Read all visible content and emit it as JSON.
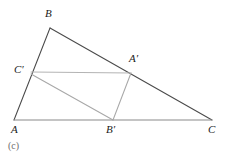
{
  "figure": {
    "caption": "(c)",
    "background_color": "#ffffff",
    "width": 226,
    "height": 161
  },
  "colors": {
    "outer_triangle_stroke": "#4a4a4a",
    "base_line_stroke": "#8a8a8a",
    "inner_horizontal_stroke": "#b4b4b4",
    "inner_diagonal_stroke": "#a8a8a8",
    "inner_vertical_stroke": "#a8a8a8",
    "label_color": "#1a1a1a",
    "caption_color": "#6e6e6e"
  },
  "points": {
    "A": {
      "label": "A",
      "x": 14,
      "y": 120,
      "label_x": 11,
      "label_y": 124
    },
    "B": {
      "label": "B",
      "x": 50,
      "y": 28,
      "label_x": 45,
      "label_y": 8
    },
    "C": {
      "label": "C",
      "x": 212,
      "y": 120,
      "label_x": 208,
      "label_y": 124
    },
    "Aprime": {
      "label": "A′",
      "x": 131,
      "y": 73,
      "label_x": 129,
      "label_y": 53
    },
    "Bprime": {
      "label": "B′",
      "x": 113,
      "y": 120,
      "label_x": 106,
      "label_y": 124
    },
    "Cprime": {
      "label": "C′",
      "x": 31,
      "y": 72,
      "label_x": 14,
      "label_y": 64
    }
  },
  "segments": [
    {
      "name": "side-AB",
      "from": "A",
      "to": "B",
      "style": "outer"
    },
    {
      "name": "side-BC",
      "from": "B",
      "to": "C",
      "style": "outer"
    },
    {
      "name": "side-AC",
      "from": "A",
      "to": "C",
      "style": "base"
    },
    {
      "name": "segment-Cprime-Aprime",
      "from": "Cprime",
      "to": "Aprime",
      "style": "inner-horizontal"
    },
    {
      "name": "segment-Cprime-Bprime",
      "from": "Cprime",
      "to": "Bprime",
      "style": "inner-diagonal"
    },
    {
      "name": "segment-Aprime-Bprime",
      "from": "Aprime",
      "to": "Bprime",
      "style": "inner-vertical"
    }
  ]
}
